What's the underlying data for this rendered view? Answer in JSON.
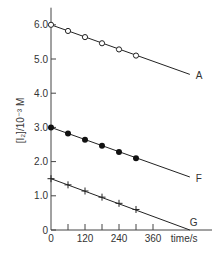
{
  "chart_data": {
    "type": "line",
    "title": "",
    "xlabel": "time/s",
    "ylabel": "[I₂]/10⁻³ M",
    "xlim": [
      0,
      500
    ],
    "ylim": [
      0,
      6.5
    ],
    "x_ticks": [
      0,
      120,
      240,
      360
    ],
    "x_minor_ticks": [
      60,
      180,
      300
    ],
    "y_ticks": [
      0,
      1.0,
      2.0,
      3.0,
      4.0,
      5.0,
      6.0
    ],
    "y_tick_labels": [
      "0",
      "1.0",
      "2.0",
      "3.0",
      "4.0",
      "5.0",
      "6.0"
    ],
    "grid": false,
    "legend": "inline labels at line ends",
    "series": [
      {
        "name": "A",
        "marker": "open-circle",
        "x": [
          0,
          60,
          120,
          180,
          240,
          300
        ],
        "values": [
          6.0,
          5.82,
          5.64,
          5.46,
          5.28,
          5.1
        ],
        "line_end": [
          490,
          4.55
        ]
      },
      {
        "name": "F",
        "marker": "filled-circle",
        "x": [
          0,
          60,
          120,
          180,
          240,
          300
        ],
        "values": [
          3.0,
          2.82,
          2.64,
          2.46,
          2.28,
          2.1
        ],
        "line_end": [
          490,
          1.55
        ]
      },
      {
        "name": "G",
        "marker": "plus",
        "x": [
          0,
          60,
          120,
          180,
          240,
          300
        ],
        "values": [
          1.5,
          1.32,
          1.14,
          0.96,
          0.78,
          0.6
        ],
        "line_end": [
          490,
          0.0
        ]
      }
    ]
  }
}
